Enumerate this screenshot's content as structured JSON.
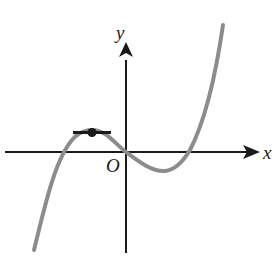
{
  "diagram": {
    "type": "function-graph",
    "labels": {
      "y_axis": "y",
      "x_axis": "x",
      "origin": "O"
    },
    "colors": {
      "axes": "#1a1a1a",
      "curve": "#8c8c8c",
      "tangent": "#1a1a1a",
      "point": "#1a1a1a",
      "background": "#ffffff"
    },
    "features": {
      "x_intercepts": [
        "negative root",
        "origin",
        "positive root"
      ],
      "local_max": "marked with dot and horizontal tangent segment",
      "local_min": "right of origin, below x-axis"
    }
  }
}
